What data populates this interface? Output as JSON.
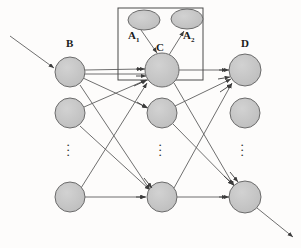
{
  "figure": {
    "type": "neural-network-diagram",
    "title": "",
    "background_color": "#fdfcfb",
    "node_fill": "#c6c6c6",
    "node_stroke": "#6b6b6b",
    "edge_color": "#5a5a5a",
    "box_stroke": "#4a4a4a",
    "label_color": "#1b1b1b"
  },
  "labels": {
    "a1": "A",
    "a1_sub": "1",
    "a2": "A",
    "a2_sub": "2",
    "b": "B",
    "c": "C",
    "d": "D"
  },
  "ellipsis": {
    "glyph": "·",
    "columns": [
      {
        "name": "column-b-dots",
        "x": 70,
        "y": 148
      },
      {
        "name": "column-c-dots",
        "x": 162,
        "y": 148
      },
      {
        "name": "column-d-dots",
        "x": 243,
        "y": 148
      }
    ]
  },
  "nodes": {
    "top_ellipses": [
      {
        "id": "a1-node",
        "cx": 144,
        "cy": 20,
        "rx": 16,
        "ry": 10
      },
      {
        "id": "a2-node",
        "cx": 187,
        "cy": 19,
        "rx": 16,
        "ry": 10
      }
    ],
    "column_b": [
      {
        "id": "b-node-1",
        "cx": 70,
        "cy": 72,
        "r": 15
      },
      {
        "id": "b-node-2",
        "cx": 70,
        "cy": 113,
        "r": 15
      },
      {
        "id": "b-node-3",
        "cx": 70,
        "cy": 197,
        "r": 15
      }
    ],
    "column_c": [
      {
        "id": "c-node-1",
        "cx": 162,
        "cy": 70,
        "r": 17
      },
      {
        "id": "c-node-2",
        "cx": 162,
        "cy": 113,
        "r": 15
      },
      {
        "id": "c-node-3",
        "cx": 162,
        "cy": 197,
        "r": 15
      }
    ],
    "column_d": [
      {
        "id": "d-node-1",
        "cx": 245,
        "cy": 70,
        "r": 16
      },
      {
        "id": "d-node-2",
        "cx": 245,
        "cy": 113,
        "r": 15
      },
      {
        "id": "d-node-3",
        "cx": 245,
        "cy": 197,
        "r": 16
      }
    ]
  },
  "box": {
    "id": "layer-c-box",
    "x": 118,
    "y": 8,
    "width": 85,
    "height": 72
  },
  "external_arrows": {
    "input": {
      "id": "input-arrow",
      "x1": 10,
      "y1": 36,
      "x2": 56,
      "y2": 69
    },
    "output": {
      "id": "output-arrow",
      "x1": 256,
      "y1": 207,
      "x2": 295,
      "y2": 238
    }
  }
}
